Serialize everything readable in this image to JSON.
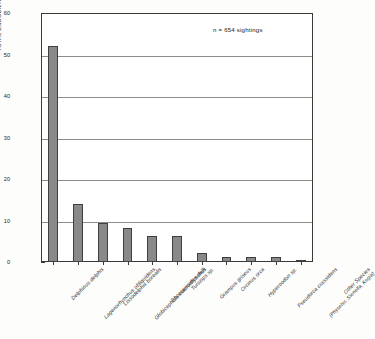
{
  "chart_data": {
    "type": "bar",
    "title": "",
    "xlabel": "",
    "ylabel": "TOTAL ENCOUNTERS WITH ODONTOCETES, percent",
    "ylim": [
      0,
      60
    ],
    "yticks": [
      0,
      10,
      20,
      30,
      40,
      50,
      60
    ],
    "ytick_labels": [
      "0",
      "10",
      "20",
      "30",
      "40",
      "50",
      "60"
    ],
    "minor_tick_interval": 5,
    "grid": "horizontal",
    "legend": "none",
    "annotation": "n = 654 sightings",
    "bar_color": "#898989",
    "bar_edge_color": "#3f3f3d",
    "categories": [
      "Delphinus delphis",
      "Lagenorhynchus obliquidens",
      "Lissodelphis borealis",
      "Globicephala macrorhynchus",
      "Phocoenoides dalli",
      "Tursiops sp.",
      "Grampus griseus",
      "Orcinus orca",
      "Hyperoodon sp.",
      "Pseudorca crassidens",
      "Other Species"
    ],
    "category_sublabels": [
      "",
      "",
      "",
      "",
      "",
      "",
      "",
      "",
      "",
      "",
      "(Physeter, Stenella, Kogia)"
    ],
    "values": [
      52,
      14,
      9.3,
      8.3,
      6.3,
      6.3,
      2.2,
      1.2,
      1.1,
      1.1,
      0.6
    ]
  }
}
